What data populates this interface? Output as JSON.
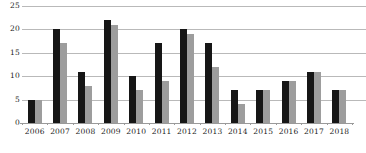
{
  "chart_data": {
    "type": "bar",
    "title": "",
    "subtitle": "",
    "xlabel": "",
    "ylabel": "",
    "categories": [
      "2006",
      "2007",
      "2008",
      "2009",
      "2010",
      "2011",
      "2012",
      "2013",
      "2014",
      "2015",
      "2016",
      "2017",
      "2018"
    ],
    "series": [
      {
        "name": "series-1",
        "color": "#161616",
        "values": [
          5,
          20,
          11,
          22,
          10,
          17,
          20,
          17,
          7,
          7,
          9,
          11,
          7
        ]
      },
      {
        "name": "series-2",
        "color": "#9d9d9d",
        "values": [
          5,
          17,
          8,
          21,
          7,
          9,
          19,
          12,
          4,
          7,
          9,
          11,
          7
        ]
      }
    ],
    "ylim": [
      0,
      25
    ],
    "ytick_labels": [
      "0",
      "5",
      "10",
      "15",
      "20",
      "25"
    ],
    "ytick_values": [
      0,
      5,
      10,
      15,
      20,
      25
    ],
    "grid": true,
    "grid_axis": "y",
    "legend": false,
    "legend_position": "none"
  }
}
